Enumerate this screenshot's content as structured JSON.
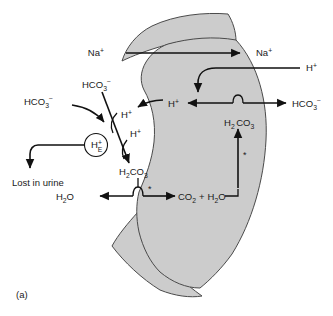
{
  "figure": {
    "panel_label": "(a)",
    "enzyme_marker": "*"
  },
  "labels": {
    "na_lumen": {
      "base": "Na",
      "sup": "+"
    },
    "na_cell": {
      "base": "Na",
      "sup": "+"
    },
    "h_blood": {
      "base": "H",
      "sup": "+"
    },
    "h_cell": {
      "base": "H",
      "sup": "+"
    },
    "h_lumen_upper": {
      "base": "H",
      "sup": "+"
    },
    "h_lumen_lower": {
      "base": "H",
      "sup": "+"
    },
    "hco3_upper_left": {
      "base": "HCO",
      "sub": "3",
      "sup": "−"
    },
    "hco3_left": {
      "base": "HCO",
      "sub": "3",
      "sup": "−"
    },
    "hco3_right": {
      "base": "HCO",
      "sub": "3",
      "sup": "−"
    },
    "h_e_buffer": {
      "base": "H",
      "sup": "+",
      "sub": "E"
    },
    "h2co3_lumen": {
      "base": "H",
      "sub1": "2",
      "mid": "CO",
      "sub2": "3"
    },
    "h2co3_cell": {
      "base": "H",
      "sub1": "2",
      "mid": "CO",
      "sub2": "3"
    },
    "h2o_lumen": {
      "base": "H",
      "sub": "2",
      "tail": "O"
    },
    "co2_h2o_cell": {
      "co2_base": "CO",
      "co2_sub": "2",
      "plus": "+",
      "h2o_base": "H",
      "h2o_sub": "2",
      "h2o_tail": "O"
    },
    "lost_in_urine": "Lost in urine"
  },
  "colors": {
    "cell_fill": "#cccccc",
    "cell_stroke": "#4a4a4a",
    "arrow": "#111111",
    "text": "#1a1a1a",
    "background": "#ffffff"
  }
}
